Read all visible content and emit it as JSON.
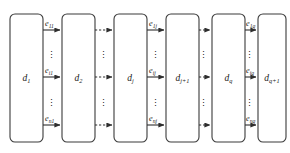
{
  "diagram": {
    "canvas": {
      "width": 290,
      "height": 153,
      "background": "#ffffff"
    },
    "stroke_color": "#2e2e2e",
    "node_stroke_color": "#3b3b3b",
    "text_color": "#1a1a1a",
    "ellipsis_glyph": "⋮",
    "nodes": [
      {
        "id": "d1",
        "base": "d",
        "sub": "1",
        "label": "d₁",
        "x": 10,
        "width": 33
      },
      {
        "id": "d2",
        "base": "d",
        "sub": "2",
        "label": "d₂",
        "x": 62,
        "width": 33
      },
      {
        "id": "dj",
        "base": "d",
        "sub": "j",
        "label": "dⱼ",
        "x": 114,
        "width": 33
      },
      {
        "id": "dj1",
        "base": "d",
        "sub": "j+1",
        "label": "dⱼ₊₁",
        "x": 166,
        "width": 33
      },
      {
        "id": "dq",
        "base": "d",
        "sub": "q",
        "label": "d_q",
        "x": 212,
        "width": 33
      },
      {
        "id": "dq1",
        "base": "d",
        "sub": "q+1",
        "label": "d_q+1",
        "x": 258,
        "width": 28
      }
    ],
    "node_geometry": {
      "top": 14,
      "bottom": 142,
      "corner_radius": 5
    },
    "rows": [
      {
        "id": "row-top",
        "y": 30,
        "index": "1"
      },
      {
        "id": "row-middle",
        "y": 77,
        "index": "i"
      },
      {
        "id": "row-bottom",
        "y": 125,
        "index": "n"
      }
    ],
    "gaps": [
      {
        "id": "gap-1",
        "from": "d1",
        "to": "d2",
        "style": "solid",
        "labeled": true
      },
      {
        "id": "gap-2",
        "from": "d2",
        "to": "dj",
        "style": "dashed",
        "labeled": false
      },
      {
        "id": "gap-3",
        "from": "dj",
        "to": "dj1",
        "style": "solid",
        "labeled": true
      },
      {
        "id": "gap-4",
        "from": "dj1",
        "to": "dq",
        "style": "dashed",
        "labeled": false
      },
      {
        "id": "gap-5",
        "from": "dq",
        "to": "dq1",
        "style": "solid",
        "labeled": true
      }
    ],
    "edge_labels": {
      "gap1_top": {
        "base": "e",
        "sub": "11"
      },
      "gap1_middle": {
        "base": "e",
        "sub": "i1"
      },
      "gap1_bottom": {
        "base": "e",
        "sub": "n1"
      },
      "gap3_top": {
        "base": "e",
        "sub": "1j"
      },
      "gap3_middle": {
        "base": "e",
        "sub": "ij"
      },
      "gap3_bottom": {
        "base": "e",
        "sub": "nj"
      },
      "gap5_top": {
        "base": "e",
        "sub": "1q"
      },
      "gap5_middle": {
        "base": "e",
        "sub": "iq"
      },
      "gap5_bottom": {
        "base": "e",
        "sub": "nq"
      }
    },
    "column_ellipses": [
      {
        "id": "ell-col1-upper",
        "x": 48,
        "y": 55
      },
      {
        "id": "ell-col1-lower",
        "x": 48,
        "y": 103
      },
      {
        "id": "ell-col2-upper",
        "x": 100,
        "y": 55
      },
      {
        "id": "ell-col2-lower",
        "x": 100,
        "y": 103
      },
      {
        "id": "ell-col3-upper",
        "x": 152,
        "y": 55
      },
      {
        "id": "ell-col3-lower",
        "x": 152,
        "y": 103
      },
      {
        "id": "ell-col4-upper",
        "x": 200,
        "y": 55
      },
      {
        "id": "ell-col4-lower",
        "x": 200,
        "y": 103
      },
      {
        "id": "ell-col5-upper",
        "x": 246,
        "y": 55
      },
      {
        "id": "ell-col5-lower",
        "x": 246,
        "y": 103
      }
    ]
  }
}
